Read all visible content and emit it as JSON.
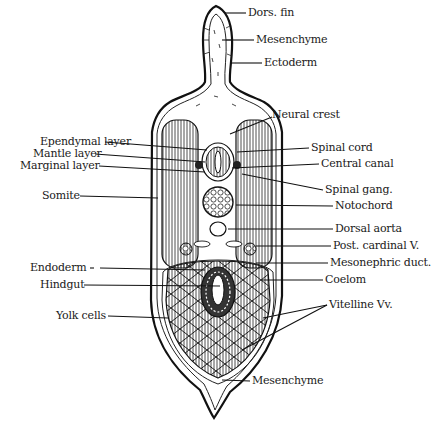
{
  "figure": {
    "labels_right": [
      {
        "id": "dors-fin",
        "text": "Dors. fin",
        "x": 248,
        "y": 8,
        "tx": 225,
        "ty": 13
      },
      {
        "id": "mesenchyme-top",
        "text": "Mesenchyme",
        "x": 256,
        "y": 36,
        "tx": 222,
        "ty": 40
      },
      {
        "id": "ectoderm",
        "text": "Ectoderm",
        "x": 264,
        "y": 59,
        "tx": 230,
        "ty": 63
      },
      {
        "id": "neural-crest",
        "text": "Neural crest",
        "x": 272,
        "y": 111,
        "tx": 230,
        "ty": 136
      },
      {
        "id": "spinal-cord",
        "text": "Spinal cord",
        "x": 311,
        "y": 144,
        "tx": 237,
        "ty": 152
      },
      {
        "id": "central-canal",
        "text": "Central canal",
        "x": 321,
        "y": 159,
        "tx": 232,
        "ty": 168
      },
      {
        "id": "spinal-gang",
        "text": "Spinal gang.",
        "x": 325,
        "y": 186,
        "tx": 242,
        "ty": 174
      },
      {
        "id": "notochord",
        "text": "Notochord",
        "x": 335,
        "y": 202,
        "tx": 240,
        "ty": 205
      },
      {
        "id": "dorsal-aorta",
        "text": "Dorsal aorta",
        "x": 335,
        "y": 225,
        "tx": 232,
        "ty": 229
      },
      {
        "id": "post-cardinal-v",
        "text": "Post. cardinal V.",
        "x": 333,
        "y": 242,
        "tx": 250,
        "ty": 246
      },
      {
        "id": "mesonephric-duct",
        "text": "Mesonephric duct.",
        "x": 330,
        "y": 259,
        "tx": 252,
        "ty": 263
      },
      {
        "id": "coelom",
        "text": "Coelom",
        "x": 325,
        "y": 276,
        "tx": 262,
        "ty": 280
      },
      {
        "id": "vitelline-vv",
        "text": "Vitelline Vv.",
        "x": 329,
        "y": 301,
        "tx": 263,
        "ty": 320
      },
      {
        "id": "mesenchyme-bottom",
        "text": "Mesenchyme",
        "x": 252,
        "y": 377,
        "tx": 222,
        "ty": 380
      }
    ],
    "labels_left": [
      {
        "id": "ependymal-layer",
        "text": "Ependymal layer",
        "x": 40,
        "y": 138,
        "tx": 207,
        "ty": 150
      },
      {
        "id": "mantle-layer",
        "text": "Mantle layer",
        "x": 33,
        "y": 150,
        "tx": 205,
        "ty": 162
      },
      {
        "id": "marginal-layer",
        "text": "Marginal layer",
        "x": 20,
        "y": 162,
        "tx": 205,
        "ty": 172
      },
      {
        "id": "somite",
        "text": "Somite",
        "x": 42,
        "y": 192,
        "tx": 158,
        "ty": 198
      },
      {
        "id": "endoderm",
        "text": "Endoderm",
        "x": 52,
        "y": 264,
        "tx": 205,
        "ty": 270
      },
      {
        "id": "hindgut",
        "text": "Hindgut",
        "x": 40,
        "y": 281,
        "tx": 220,
        "ty": 285
      },
      {
        "id": "yolk-cells",
        "text": "Yolk cells",
        "x": 56,
        "y": 312,
        "tx": 165,
        "ty": 318
      }
    ]
  }
}
